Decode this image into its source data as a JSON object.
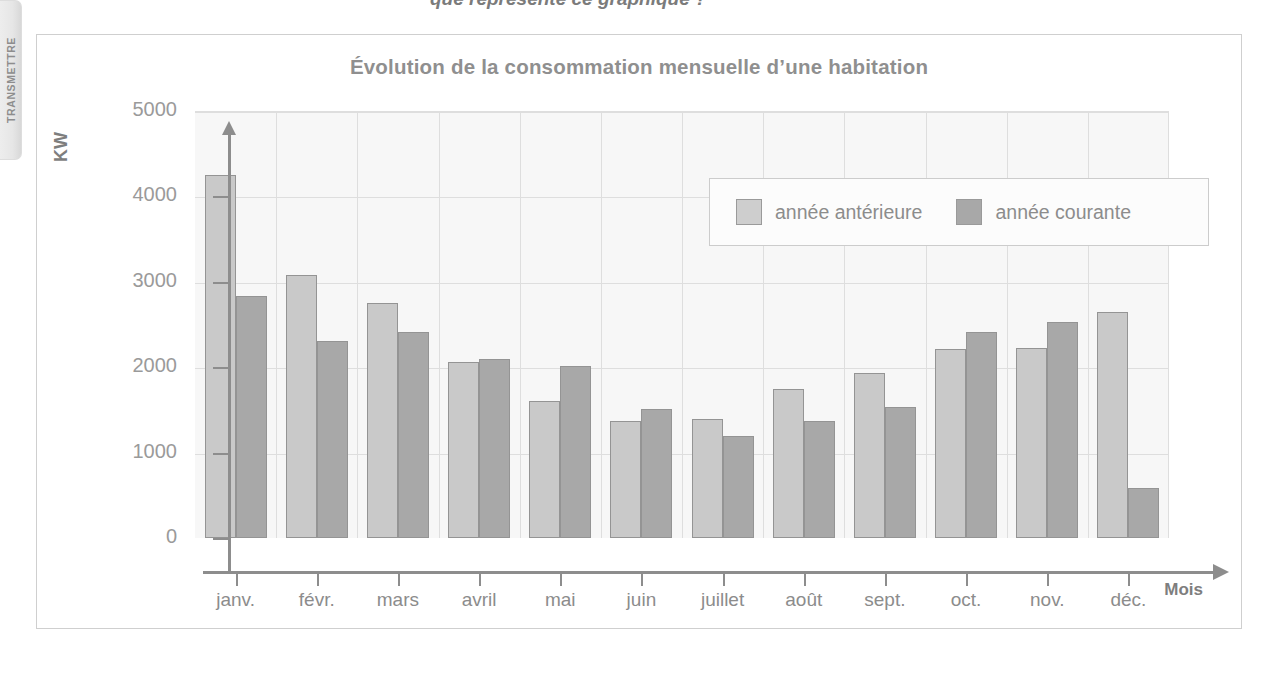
{
  "side_tab": {
    "label": "TRANSMETTRE"
  },
  "top_strip": {
    "text": "que représente ce graphique ?"
  },
  "figure": {
    "title": "Évolution de la consommation mensuelle d’une habitation",
    "ylabel": "KW",
    "xlabel": "Mois"
  },
  "legend": {
    "entries": [
      {
        "label": "année antérieure",
        "color": "#cecece"
      },
      {
        "label": "année courante",
        "color": "#a8a8a8"
      }
    ]
  },
  "chart_data": {
    "type": "bar",
    "title": "Évolution de la consommation mensuelle d’une habitation",
    "xlabel": "Mois",
    "ylabel": "KW",
    "ylim": [
      0,
      5000
    ],
    "yticks": [
      0,
      1000,
      2000,
      3000,
      4000,
      5000
    ],
    "ytick_labels": [
      "0",
      "1000",
      "2000",
      "3000",
      "4000",
      "5000"
    ],
    "grid": true,
    "legend_position": "top-right-inside",
    "categories": [
      "janv.",
      "févr.",
      "mars",
      "avril",
      "mai",
      "juin",
      "juillet",
      "août",
      "sept.",
      "oct.",
      "nov.",
      "déc."
    ],
    "series": [
      {
        "name": "année antérieure",
        "color": "#c9c9c9",
        "values": [
          4250,
          3080,
          2750,
          2060,
          1610,
          1370,
          1390,
          1740,
          1930,
          2210,
          2230,
          2650
        ]
      },
      {
        "name": "année courante",
        "color": "#a8a8a8",
        "values": [
          2830,
          2310,
          2410,
          2100,
          2020,
          1510,
          1190,
          1370,
          1530,
          2410,
          2530,
          580
        ]
      }
    ]
  }
}
